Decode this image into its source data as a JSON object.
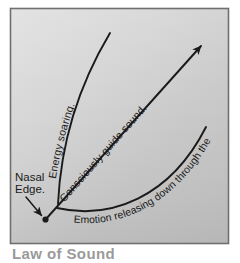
{
  "figure": {
    "name": "vocal-energy-flow-diagram",
    "frame": {
      "border_color": "#6d6d6d",
      "bg_light": "#dcdcdc",
      "bg_mid": "#c9c9c9",
      "bg_dark": "#bdbdbd"
    },
    "ink_color": "#1a1a1a",
    "origin_label": {
      "line1": "Nasal",
      "line2": "Edge.",
      "name": "nasal-edge-label"
    },
    "annotations": [
      {
        "id": "energy-soaring",
        "text": "Energy soaring.",
        "name": "energy-soaring-label"
      },
      {
        "id": "consciously-guide-sound",
        "text": "Consciously guide sound.",
        "name": "consciously-guide-sound-label"
      },
      {
        "id": "emotion-releasing",
        "text": "Emotion releasing down through the body.",
        "name": "emotion-releasing-label"
      }
    ],
    "caption_partial": "Law of Sound"
  }
}
